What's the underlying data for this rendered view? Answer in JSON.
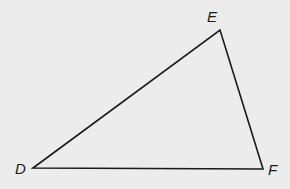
{
  "diagram": {
    "type": "triangle",
    "background": "#ececec",
    "stroke_color": "#1a1a1a",
    "vertices": [
      {
        "id": "D",
        "label": "D",
        "x": 33,
        "y": 168,
        "label_x": 15,
        "label_y": 174
      },
      {
        "id": "E",
        "label": "E",
        "x": 220,
        "y": 30,
        "label_x": 207,
        "label_y": 22
      },
      {
        "id": "F",
        "label": "F",
        "x": 263,
        "y": 169,
        "label_x": 268,
        "label_y": 175
      }
    ],
    "sides": [
      {
        "id": "DE",
        "from": "D",
        "to": "E"
      },
      {
        "id": "EF",
        "from": "E",
        "to": "F"
      },
      {
        "id": "DF",
        "from": "D",
        "to": "F"
      }
    ]
  }
}
